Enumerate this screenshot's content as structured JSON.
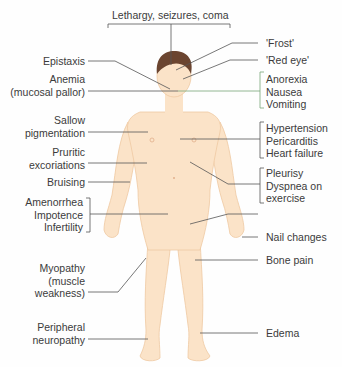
{
  "diagram": {
    "colors": {
      "skin": "#fbe3c8",
      "skin_shadow": "#f0cba6",
      "hair": "#6b4530",
      "line": "#555555",
      "text": "#3b3b3b"
    },
    "top_label": "Lethargy, seizures, coma",
    "left_labels": [
      {
        "id": "epistaxis",
        "lines": [
          "Epistaxis"
        ]
      },
      {
        "id": "anemia",
        "lines": [
          "Anemia",
          "(mucosal pallor)"
        ]
      },
      {
        "id": "sallow",
        "lines": [
          "Sallow",
          "pigmentation"
        ]
      },
      {
        "id": "pruritic",
        "lines": [
          "Pruritic",
          "excoriations"
        ]
      },
      {
        "id": "bruising",
        "lines": [
          "Bruising"
        ]
      },
      {
        "id": "reproductive",
        "lines": [
          "Amenorrhea",
          "Impotence",
          "Infertility"
        ]
      },
      {
        "id": "myopathy",
        "lines": [
          "Myopathy",
          "(muscle",
          "weakness)"
        ]
      },
      {
        "id": "neuropathy",
        "lines": [
          "Peripheral",
          "neuropathy"
        ]
      }
    ],
    "right_labels": [
      {
        "id": "frost",
        "lines": [
          "'Frost'"
        ]
      },
      {
        "id": "red-eye",
        "lines": [
          "'Red eye'"
        ]
      },
      {
        "id": "gi",
        "lines": [
          "Anorexia",
          "Nausea",
          "Vomiting"
        ]
      },
      {
        "id": "cardiac",
        "lines": [
          "Hypertension",
          "Pericarditis",
          "Heart failure"
        ]
      },
      {
        "id": "pulmonary",
        "lines": [
          "Pleurisy",
          "Dyspnea on",
          "exercise"
        ]
      },
      {
        "id": "nail",
        "lines": [
          "Nail changes"
        ]
      },
      {
        "id": "bone",
        "lines": [
          "Bone pain"
        ]
      },
      {
        "id": "edema",
        "lines": [
          "Edema"
        ]
      }
    ]
  }
}
